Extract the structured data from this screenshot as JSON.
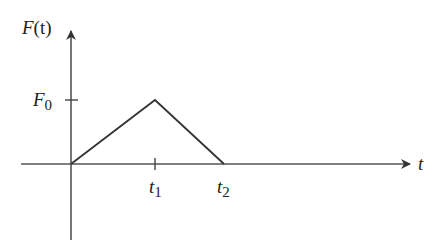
{
  "diagram": {
    "type": "triangular pulse force vs time",
    "colors": {
      "line": "#333333",
      "text": "#222222",
      "background": "#ffffff"
    },
    "y_axis": {
      "label_main": "F",
      "label_paren": "(t)"
    },
    "x_axis": {
      "label": "t"
    },
    "y_ticks": [
      {
        "label_main": "F",
        "label_sub": "0"
      }
    ],
    "x_ticks": [
      {
        "label_main": "t",
        "label_sub": "1"
      },
      {
        "label_main": "t",
        "label_sub": "2"
      }
    ],
    "curve_points": [
      {
        "t": "0",
        "F": "0"
      },
      {
        "t": "t1",
        "F": "F0"
      },
      {
        "t": "t2",
        "F": "0"
      }
    ]
  }
}
